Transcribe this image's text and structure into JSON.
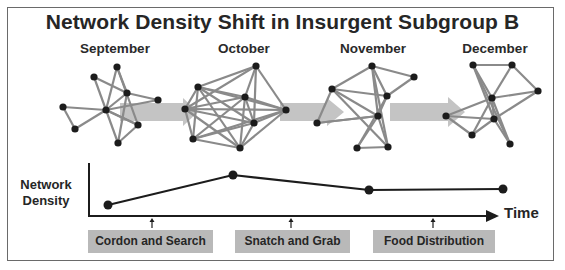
{
  "title": "Network Density Shift in Insurgent Subgroup B",
  "months": [
    "September",
    "October",
    "November",
    "December"
  ],
  "colors": {
    "edge": "#8a8a8a",
    "node": "#1c1c1c",
    "band": "#c4c4c4",
    "line": "#1c1c1c",
    "event_box": "#b9b9b9",
    "frame": "#6a6a6a"
  },
  "networks": [
    {
      "month": "September",
      "nodes": [
        [
          117,
          67
        ],
        [
          94,
          77
        ],
        [
          127,
          93
        ],
        [
          158,
          100
        ],
        [
          106,
          110
        ],
        [
          63,
          107
        ],
        [
          75,
          129
        ],
        [
          138,
          125
        ],
        [
          118,
          143
        ]
      ],
      "edges": [
        [
          0,
          4
        ],
        [
          0,
          7
        ],
        [
          1,
          2
        ],
        [
          1,
          4
        ],
        [
          2,
          3
        ],
        [
          2,
          4
        ],
        [
          2,
          8
        ],
        [
          4,
          3
        ],
        [
          4,
          5
        ],
        [
          4,
          6
        ],
        [
          4,
          7
        ],
        [
          4,
          8
        ],
        [
          5,
          6
        ],
        [
          7,
          8
        ],
        [
          0,
          2
        ],
        [
          4,
          7
        ]
      ]
    },
    {
      "month": "October",
      "nodes": [
        [
          185,
          109
        ],
        [
          198,
          87
        ],
        [
          256,
          66
        ],
        [
          245,
          97
        ],
        [
          286,
          110
        ],
        [
          254,
          123
        ],
        [
          193,
          139
        ],
        [
          240,
          148
        ]
      ],
      "edges": [
        [
          0,
          1
        ],
        [
          0,
          3
        ],
        [
          0,
          4
        ],
        [
          0,
          5
        ],
        [
          0,
          6
        ],
        [
          0,
          7
        ],
        [
          1,
          2
        ],
        [
          1,
          3
        ],
        [
          1,
          4
        ],
        [
          1,
          5
        ],
        [
          1,
          6
        ],
        [
          1,
          7
        ],
        [
          2,
          3
        ],
        [
          2,
          4
        ],
        [
          2,
          5
        ],
        [
          3,
          4
        ],
        [
          3,
          5
        ],
        [
          3,
          6
        ],
        [
          3,
          7
        ],
        [
          4,
          5
        ],
        [
          4,
          6
        ],
        [
          4,
          7
        ],
        [
          5,
          6
        ],
        [
          5,
          7
        ],
        [
          6,
          7
        ],
        [
          0,
          2
        ]
      ]
    },
    {
      "month": "November",
      "nodes": [
        [
          372,
          66
        ],
        [
          414,
          77
        ],
        [
          332,
          89
        ],
        [
          387,
          96
        ],
        [
          378,
          116
        ],
        [
          317,
          123
        ],
        [
          357,
          148
        ],
        [
          388,
          147
        ]
      ],
      "edges": [
        [
          0,
          1
        ],
        [
          0,
          2
        ],
        [
          0,
          3
        ],
        [
          0,
          4
        ],
        [
          0,
          7
        ],
        [
          1,
          3
        ],
        [
          2,
          3
        ],
        [
          2,
          4
        ],
        [
          2,
          5
        ],
        [
          2,
          7
        ],
        [
          3,
          4
        ],
        [
          3,
          6
        ],
        [
          4,
          5
        ],
        [
          4,
          6
        ],
        [
          4,
          7
        ],
        [
          6,
          7
        ],
        [
          5,
          4
        ]
      ]
    },
    {
      "month": "December",
      "nodes": [
        [
          473,
          65
        ],
        [
          512,
          65
        ],
        [
          538,
          91
        ],
        [
          492,
          98
        ],
        [
          494,
          119
        ],
        [
          446,
          116
        ],
        [
          472,
          135
        ],
        [
          510,
          144
        ]
      ],
      "edges": [
        [
          0,
          1
        ],
        [
          0,
          3
        ],
        [
          0,
          4
        ],
        [
          0,
          7
        ],
        [
          1,
          3
        ],
        [
          1,
          2
        ],
        [
          2,
          3
        ],
        [
          2,
          4
        ],
        [
          3,
          4
        ],
        [
          3,
          5
        ],
        [
          3,
          6
        ],
        [
          4,
          5
        ],
        [
          4,
          6
        ],
        [
          5,
          6
        ],
        [
          3,
          7
        ],
        [
          4,
          7
        ]
      ]
    }
  ],
  "chart_data": {
    "type": "line",
    "title": "",
    "xlabel": "Time",
    "ylabel": "Network Density",
    "categories": [
      "September",
      "October",
      "November",
      "December"
    ],
    "values": [
      1,
      4,
      2.5,
      2.5
    ],
    "ylim": [
      0,
      5
    ],
    "grid": false,
    "events": [
      {
        "label": "Cordon and Search",
        "between": [
          "September",
          "October"
        ]
      },
      {
        "label": "Snatch and Grab",
        "between": [
          "October",
          "November"
        ]
      },
      {
        "label": "Food Distribution",
        "between": [
          "November",
          "December"
        ]
      }
    ]
  },
  "chart_layout": {
    "points": [
      [
        108,
        205
      ],
      [
        233,
        175
      ],
      [
        369,
        190
      ],
      [
        503,
        189
      ]
    ],
    "event_arrows_x": [
      152,
      291,
      433
    ]
  },
  "events": [
    "Cordon and Search",
    "Snatch and Grab",
    "Food Distribution"
  ],
  "ylabel_line1": "Network",
  "ylabel_line2": "Density",
  "xlabel": "Time"
}
